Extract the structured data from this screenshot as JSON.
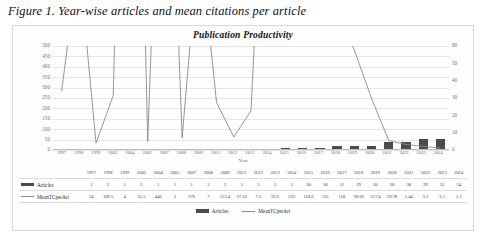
{
  "figure": {
    "caption": "Figure 1. Year-wise articles and mean citations per article"
  },
  "chart_data": {
    "type": "bar",
    "title": "Publication Productivity",
    "xlabel": "Year",
    "ylabel": "",
    "ylim": [
      0,
      500
    ],
    "y2lim": [
      0,
      60
    ],
    "grid": true,
    "legend_position": "bottom",
    "categories": [
      "1997",
      "1998",
      "1999",
      "2002",
      "2004",
      "2005",
      "2007",
      "2008",
      "2009",
      "2011",
      "2012",
      "2013",
      "2014",
      "2015",
      "2016",
      "2017",
      "2018",
      "2019",
      "2020",
      "2021",
      "2022",
      "2023",
      "2024"
    ],
    "yticks": [
      "0",
      "50",
      "100",
      "150",
      "200",
      "250",
      "300",
      "350",
      "400",
      "450",
      "500"
    ],
    "y2ticks": [
      "0",
      "10",
      "20",
      "30",
      "40",
      "50",
      "60"
    ],
    "series": [
      {
        "name": "Articles",
        "axis": "left",
        "render": "bar",
        "color": "#4b4b4b",
        "values": [
          1,
          2,
          1,
          2,
          1,
          1,
          1,
          2,
          3,
          5,
          5,
          5,
          5,
          10,
          10,
          11,
          19,
          20,
          20,
          38,
          39,
          51,
          54
        ]
      },
      {
        "name": "MeanTCperArt",
        "axis": "right",
        "render": "line",
        "color": "#8a8a8a",
        "values": [
          34,
          109.5,
          4,
          31.5,
          440,
          5,
          276,
          7,
          123.4,
          27.33,
          7.5,
          22.6,
          225,
          110.6,
          135,
          110,
          78.66,
          57.74,
          29.78,
          5.44,
          3.2,
          2.1,
          1.1
        ]
      }
    ]
  },
  "data_table": {
    "header_row": [
      "1997",
      "1998",
      "1999",
      "2002",
      "2004",
      "2005",
      "2007",
      "2008",
      "2009",
      "2011",
      "2012",
      "2013",
      "2014",
      "2015",
      "2016",
      "2017",
      "2018",
      "2019",
      "2020",
      "2021",
      "2022",
      "2023",
      "2024"
    ],
    "rows": [
      {
        "label": "Articles",
        "marker": "bar-swatch",
        "values": [
          "1",
          "2",
          "1",
          "2",
          "1",
          "1",
          "1",
          "2",
          "3",
          "5",
          "5",
          "5",
          "5",
          "10",
          "10",
          "11",
          "19",
          "20",
          "20",
          "38",
          "39",
          "51",
          "54"
        ]
      },
      {
        "label": "MeanTCperArt",
        "marker": "line-swatch",
        "values": [
          "34",
          "109.5",
          "4",
          "31.5",
          "440",
          "5",
          "276",
          "7",
          "123.4",
          "27.33",
          "7.5",
          "22.6",
          "225",
          "110.6",
          "135",
          "110",
          "78.66",
          "57.74",
          "29.78",
          "5.44",
          "3.2",
          "2.1",
          "1.1"
        ]
      }
    ]
  },
  "legend": {
    "items": [
      {
        "label": "Articles",
        "marker": "bar-swatch",
        "color": "#4b4b4b"
      },
      {
        "label": "MeanTCperArt",
        "marker": "line-swatch",
        "color": "#8a8a8a"
      }
    ]
  }
}
